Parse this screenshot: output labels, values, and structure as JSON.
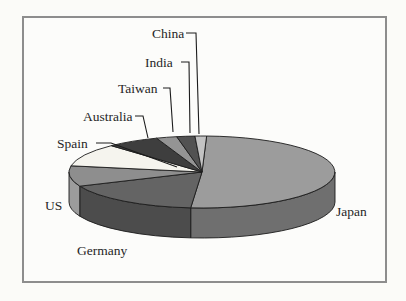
{
  "figure": {
    "frame_border_color": "#8d8d8d",
    "background_color": "#fbfbf8",
    "outline_color": "#1c1c1c",
    "label_text_color": "#262626"
  },
  "chart_data": {
    "type": "pie",
    "style": "3d-pie",
    "title": "",
    "legend": "none",
    "label_style": "callout-and-adjacent-labels",
    "values_note": "no numeric values printed on chart; percentages estimated from slice arc angles",
    "categories": [
      "Japan",
      "Germany",
      "US",
      "Spain",
      "Australia",
      "Taiwan",
      "India",
      "China"
    ],
    "values": [
      50.8,
      17.2,
      9.2,
      10.3,
      6.4,
      2.5,
      2.2,
      1.4
    ],
    "slices": [
      {
        "label": "Japan",
        "value": 50.8,
        "color_top": "#9c9c9c",
        "color_side": "#6f6f6f"
      },
      {
        "label": "Germany",
        "value": 17.2,
        "color_top": "#646464",
        "color_side": "#4c4c4c"
      },
      {
        "label": "US",
        "value": 9.2,
        "color_top": "#8e8e8e",
        "color_side": "#9c9c9c"
      },
      {
        "label": "Spain",
        "value": 10.3,
        "color_top": "#f5f4ee",
        "color_side": "#d8d7d0"
      },
      {
        "label": "Australia",
        "value": 6.4,
        "color_top": "#3e3e3e",
        "color_side": "#333333"
      },
      {
        "label": "Taiwan",
        "value": 2.5,
        "color_top": "#949494",
        "color_side": "#7d7d7d"
      },
      {
        "label": "India",
        "value": 2.2,
        "color_top": "#525252",
        "color_side": "#404040"
      },
      {
        "label": "China",
        "value": 1.4,
        "color_top": "#c3c3c3",
        "color_side": "#a8a8a8"
      }
    ]
  }
}
